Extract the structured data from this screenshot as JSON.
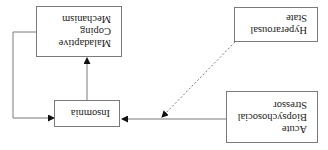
{
  "orientation": "rotated 180 degrees",
  "nodes": {
    "stressor": {
      "lines": [
        "Acute",
        "Biopsychosocial",
        "Stressor"
      ]
    },
    "hyperarousal": {
      "lines": [
        "Hyperarousal",
        "State"
      ]
    },
    "insomnia": {
      "lines": [
        "Insomnia"
      ]
    },
    "coping": {
      "lines": [
        "Maladaptive",
        "Coping",
        "Mechanism"
      ]
    }
  },
  "edges": [
    {
      "from": "Acute Biopsychosocial Stressor",
      "to": "Insomnia",
      "style": "solid"
    },
    {
      "from": "Hyperarousal State",
      "to": "Stressor-Insomnia link",
      "style": "dashed"
    },
    {
      "from": "Insomnia",
      "to": "Maladaptive Coping Mechanism",
      "style": "solid"
    },
    {
      "from": "Maladaptive Coping Mechanism",
      "to": "Insomnia",
      "style": "solid"
    }
  ],
  "colors": {
    "line": "#7a7a7a",
    "arrow": "#111111",
    "text": "#222222"
  }
}
